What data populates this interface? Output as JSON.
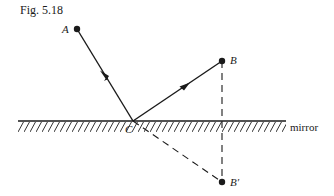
{
  "figure": {
    "title": "Fig. 5.18",
    "points": {
      "A": {
        "label": "A",
        "x": 77,
        "y": 29
      },
      "B": {
        "label": "B",
        "x": 222,
        "y": 61
      },
      "B_prime": {
        "label": "B′",
        "x": 222,
        "y": 182
      },
      "C": {
        "label": "C",
        "x": 133,
        "y": 121
      }
    },
    "mirror": {
      "label": "mirror",
      "y": 121,
      "x_start": 18,
      "x_end": 286
    },
    "rays": [
      {
        "from": "A",
        "to": "C",
        "style": "solid",
        "arrow": true
      },
      {
        "from": "C",
        "to": "B",
        "style": "solid",
        "arrow": true
      },
      {
        "from": "C",
        "to": "B_prime",
        "style": "dashed",
        "arrow": false
      },
      {
        "from": "B",
        "to": "B_prime",
        "style": "dashed",
        "arrow": false
      }
    ],
    "colors": {
      "ink": "#1a1a1a",
      "background": "#ffffff"
    }
  }
}
